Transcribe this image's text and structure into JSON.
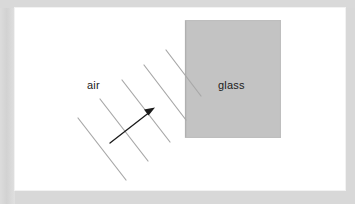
{
  "page": {
    "background_color": "#d8d8d8",
    "card_background_color": "#ffffff"
  },
  "figure": {
    "name": "refraction-wavefront-diagram",
    "media_labels": {
      "air": "air",
      "glass": "glass"
    },
    "glass_block": {
      "fill_color": "#c3c3c3",
      "edge_color": "#b2b2b2",
      "x": 170,
      "y": 12,
      "width": 96,
      "height": 118
    },
    "wavefronts": {
      "stroke_color": "#a8a8a8",
      "stroke_width": 1.2,
      "count": 5,
      "lines": [
        {
          "x1": 63,
          "y1": 110,
          "x2": 111,
          "y2": 172
        },
        {
          "x1": 85,
          "y1": 91,
          "x2": 133,
          "y2": 153
        },
        {
          "x1": 107,
          "y1": 72,
          "x2": 155,
          "y2": 134
        },
        {
          "x1": 129,
          "y1": 57,
          "x2": 171,
          "y2": 112
        },
        {
          "x1": 151,
          "y1": 42,
          "x2": 186,
          "y2": 88
        }
      ]
    },
    "ray_arrow": {
      "stroke_color": "#1b1b1b",
      "stroke_width": 1.3,
      "tail_x": 95,
      "tail_y": 135,
      "tip_x": 139,
      "tip_y": 100,
      "label": "propagation-direction"
    }
  }
}
